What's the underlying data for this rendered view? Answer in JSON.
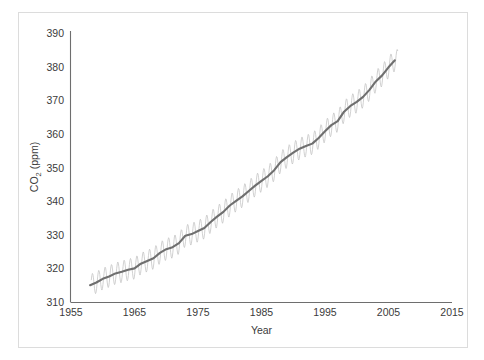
{
  "figure": {
    "frame_border_color": "#dcdcdc",
    "background": "#ffffff",
    "axis_color": "#6e6e6e",
    "monthly_color": "#c2c2c2",
    "trend_color": "#6f6f6f"
  },
  "labels": {
    "y_axis_title_main": "CO",
    "y_axis_title_sub": "2",
    "y_axis_title_unit": " (ppm)",
    "x_axis_title": "Year",
    "y_ticks": [
      "310",
      "320",
      "330",
      "340",
      "350",
      "360",
      "370",
      "380",
      "390"
    ],
    "x_ticks": [
      "1955",
      "1965",
      "1975",
      "1985",
      "1995",
      "2005",
      "2015"
    ]
  },
  "chart_data": {
    "type": "line",
    "title": "",
    "subtitle": "",
    "xlabel": "Year",
    "ylabel": "CO2 (ppm)",
    "xlim": [
      1955,
      2015
    ],
    "ylim": [
      310,
      390
    ],
    "xticks": [
      1955,
      1965,
      1975,
      1985,
      1995,
      2005,
      2015
    ],
    "yticks": [
      310,
      320,
      330,
      340,
      350,
      360,
      370,
      380,
      390
    ],
    "grid": false,
    "legend": "none",
    "annotations": [],
    "seasonal_amplitude_ppm": 3.2,
    "seasonal_peak_month": 5,
    "seasonal_trough_month": 10,
    "series": [
      {
        "name": "Monthly mean CO2",
        "style": "thin-light-line-with-seasonal-cycle",
        "color": "#c2c2c2"
      },
      {
        "name": "Annual trend (seasonally adjusted)",
        "style": "thick-gray-line",
        "color": "#6f6f6f",
        "x": [
          1958,
          1959,
          1960,
          1961,
          1962,
          1963,
          1964,
          1965,
          1966,
          1967,
          1968,
          1969,
          1970,
          1971,
          1972,
          1973,
          1974,
          1975,
          1976,
          1977,
          1978,
          1979,
          1980,
          1981,
          1982,
          1983,
          1984,
          1985,
          1986,
          1987,
          1988,
          1989,
          1990,
          1991,
          1992,
          1993,
          1994,
          1995,
          1996,
          1997,
          1998,
          1999,
          2000,
          2001,
          2002,
          2003,
          2004,
          2005,
          2006
        ],
        "values": [
          315.0,
          315.8,
          316.9,
          317.6,
          318.5,
          319.0,
          319.6,
          320.0,
          321.4,
          322.2,
          323.0,
          324.6,
          325.7,
          326.3,
          327.5,
          329.7,
          330.2,
          331.1,
          332.0,
          333.8,
          335.4,
          336.8,
          338.7,
          340.1,
          341.4,
          343.0,
          344.6,
          346.0,
          347.4,
          349.2,
          351.6,
          353.1,
          354.4,
          355.6,
          356.4,
          357.1,
          358.8,
          360.8,
          362.6,
          363.8,
          366.6,
          368.3,
          369.5,
          371.0,
          373.1,
          375.6,
          377.4,
          379.8,
          381.9
        ]
      }
    ]
  }
}
